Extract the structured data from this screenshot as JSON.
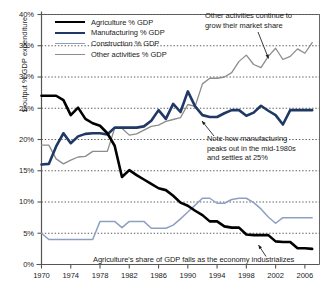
{
  "chart_data": {
    "type": "line",
    "title": "",
    "xlabel": "",
    "ylabel": "$ output % GDP expenditure",
    "xlim": [
      1970,
      2008
    ],
    "ylim": [
      0,
      40
    ],
    "grid": "horizontal-dotted",
    "legend_position": "top-left-inside",
    "ytick_labels": [
      "0%",
      "5%",
      "10%",
      "15%",
      "20%",
      "25%",
      "30%",
      "35%",
      "40%"
    ],
    "ytick_values": [
      0,
      5,
      10,
      15,
      20,
      25,
      30,
      35,
      40
    ],
    "xtick_labels": [
      "1970",
      "1974",
      "1978",
      "1982",
      "1986",
      "1990",
      "1994",
      "1998",
      "2002",
      "2006"
    ],
    "xtick_values": [
      1970,
      1974,
      1978,
      1982,
      1986,
      1990,
      1994,
      1998,
      2002,
      2006
    ],
    "x": [
      1970,
      1971,
      1972,
      1973,
      1974,
      1975,
      1976,
      1977,
      1978,
      1979,
      1980,
      1981,
      1982,
      1983,
      1984,
      1985,
      1986,
      1987,
      1988,
      1989,
      1990,
      1991,
      1992,
      1993,
      1994,
      1995,
      1996,
      1997,
      1998,
      1999,
      2000,
      2001,
      2002,
      2003,
      2004,
      2005,
      2006,
      2007
    ],
    "series": [
      {
        "name": "Agriculture % GDP",
        "color": "#000000",
        "width": 2.6,
        "values": [
          27.0,
          27.0,
          27.0,
          26.3,
          23.9,
          25.1,
          23.3,
          22.6,
          22.2,
          21.0,
          19.0,
          14.0,
          15.1,
          14.3,
          13.6,
          12.9,
          12.2,
          11.9,
          11.0,
          9.9,
          9.4,
          8.6,
          7.9,
          6.9,
          6.9,
          6.1,
          5.9,
          5.9,
          4.8,
          4.7,
          4.7,
          4.7,
          3.7,
          3.6,
          3.6,
          2.6,
          2.6,
          2.5
        ]
      },
      {
        "name": "Manufacturing % GDP",
        "color": "#1f3864",
        "width": 2.6,
        "values": [
          16.0,
          16.1,
          18.9,
          21.0,
          19.4,
          20.5,
          20.9,
          21.0,
          21.0,
          20.8,
          21.9,
          21.9,
          21.9,
          21.9,
          22.1,
          23.0,
          24.7,
          23.3,
          25.7,
          24.4,
          27.7,
          25.3,
          23.9,
          23.6,
          23.6,
          24.2,
          24.7,
          24.7,
          23.8,
          24.3,
          25.4,
          24.6,
          23.9,
          22.4,
          24.7,
          24.7,
          24.7,
          24.7
        ]
      },
      {
        "name": "Construction % GDP",
        "color": "#8f9fc4",
        "width": 1.5,
        "values": [
          5.0,
          4.0,
          4.0,
          4.0,
          4.0,
          4.0,
          4.0,
          4.0,
          6.9,
          6.9,
          6.9,
          5.9,
          6.9,
          6.9,
          6.9,
          5.8,
          5.8,
          5.8,
          6.3,
          7.3,
          8.4,
          9.5,
          10.6,
          10.6,
          9.8,
          9.8,
          10.4,
          10.6,
          10.6,
          9.9,
          8.9,
          7.6,
          6.6,
          7.5,
          7.5,
          7.5,
          7.5,
          7.5
        ]
      },
      {
        "name": "Other activities % GDP",
        "color": "#8c8c8c",
        "width": 1.3,
        "values": [
          19.1,
          19.1,
          16.9,
          16.1,
          16.7,
          17.2,
          17.3,
          18.1,
          18.1,
          18.1,
          21.8,
          21.8,
          20.7,
          20.9,
          21.5,
          22.1,
          22.3,
          22.9,
          23.2,
          23.5,
          25.6,
          25.3,
          28.9,
          29.8,
          29.8,
          30.0,
          30.7,
          32.5,
          33.5,
          32.0,
          31.5,
          33.3,
          34.6,
          32.8,
          33.3,
          34.5,
          33.8,
          35.5
        ]
      }
    ],
    "annotations": [
      {
        "id": "other-growth",
        "line1": "Other activities continue to",
        "line2": "grow their market share",
        "target_series": "Other activities % GDP"
      },
      {
        "id": "manufacturing-peak",
        "line1": "Note how manufacturing",
        "line2": "peaks out in the mid-1980s",
        "line3": "and settles at 25%",
        "target_series": "Manufacturing % GDP"
      },
      {
        "id": "agriculture-fall",
        "line1": "Agriculture's share of GDP falls as the economy industrializes",
        "target_series": "Agriculture % GDP"
      }
    ]
  }
}
